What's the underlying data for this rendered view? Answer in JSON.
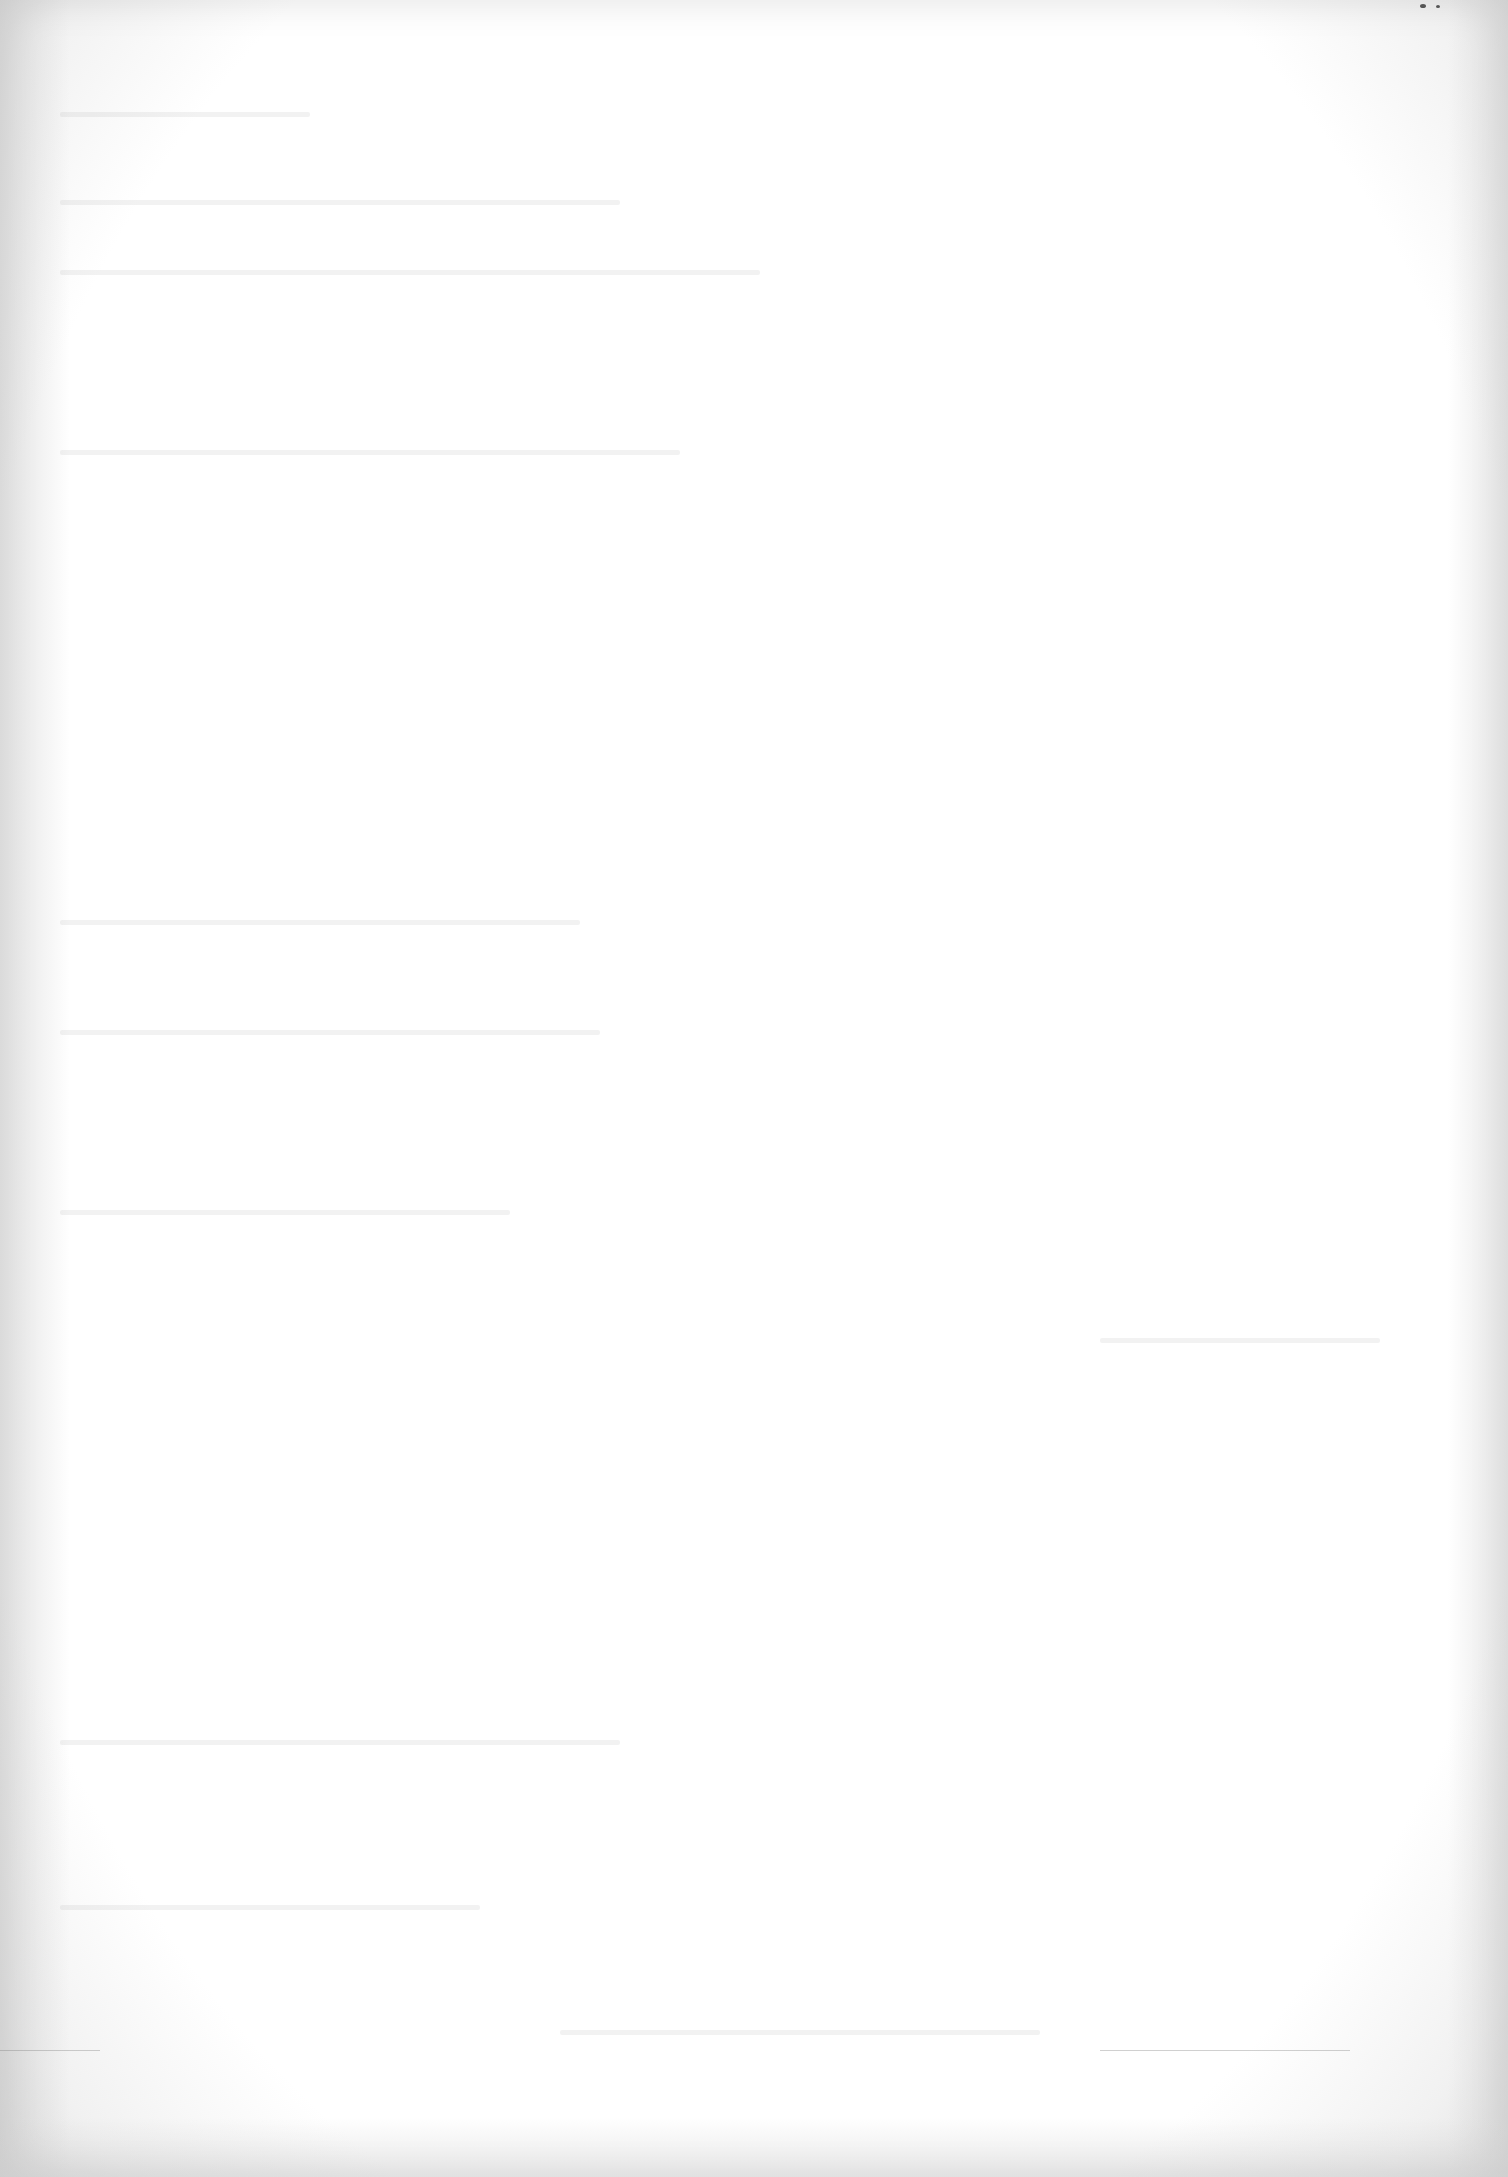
{
  "page": {
    "type": "blank scanned page",
    "visible_text": [],
    "background_color": "#ffffff",
    "edge_shadow_color": "#e2e2e2"
  }
}
